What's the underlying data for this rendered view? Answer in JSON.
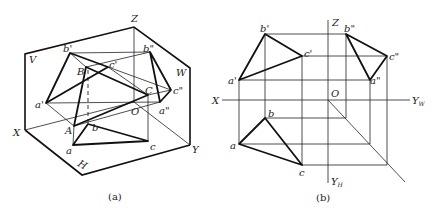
{
  "figure_a": {
    "caption": "(a)",
    "labels": {
      "Z": "Z",
      "V": "V",
      "W": "W",
      "X": "X",
      "Y": "Y",
      "O": "O",
      "H": "H",
      "b_prime": "b'",
      "c_prime": "c'",
      "a_prime": "a'",
      "B": "B",
      "C": "C",
      "A": "A",
      "b_dprime": "b\"",
      "c_dprime": "c\"",
      "a_dprime": "a\"",
      "a": "a",
      "b": "b",
      "c": "c"
    }
  },
  "figure_b": {
    "caption": "(b)",
    "labels": {
      "Z": "Z",
      "X": "X",
      "O": "O",
      "YW": "Y",
      "YW_sub": "W",
      "YH": "Y",
      "YH_sub": "H",
      "b_prime": "b'",
      "c_prime": "c'",
      "a_prime": "a'",
      "b_dprime": "b\"",
      "c_dprime": "c\"",
      "a_dprime": "a\"",
      "a": "a",
      "b": "b",
      "c": "c"
    }
  }
}
